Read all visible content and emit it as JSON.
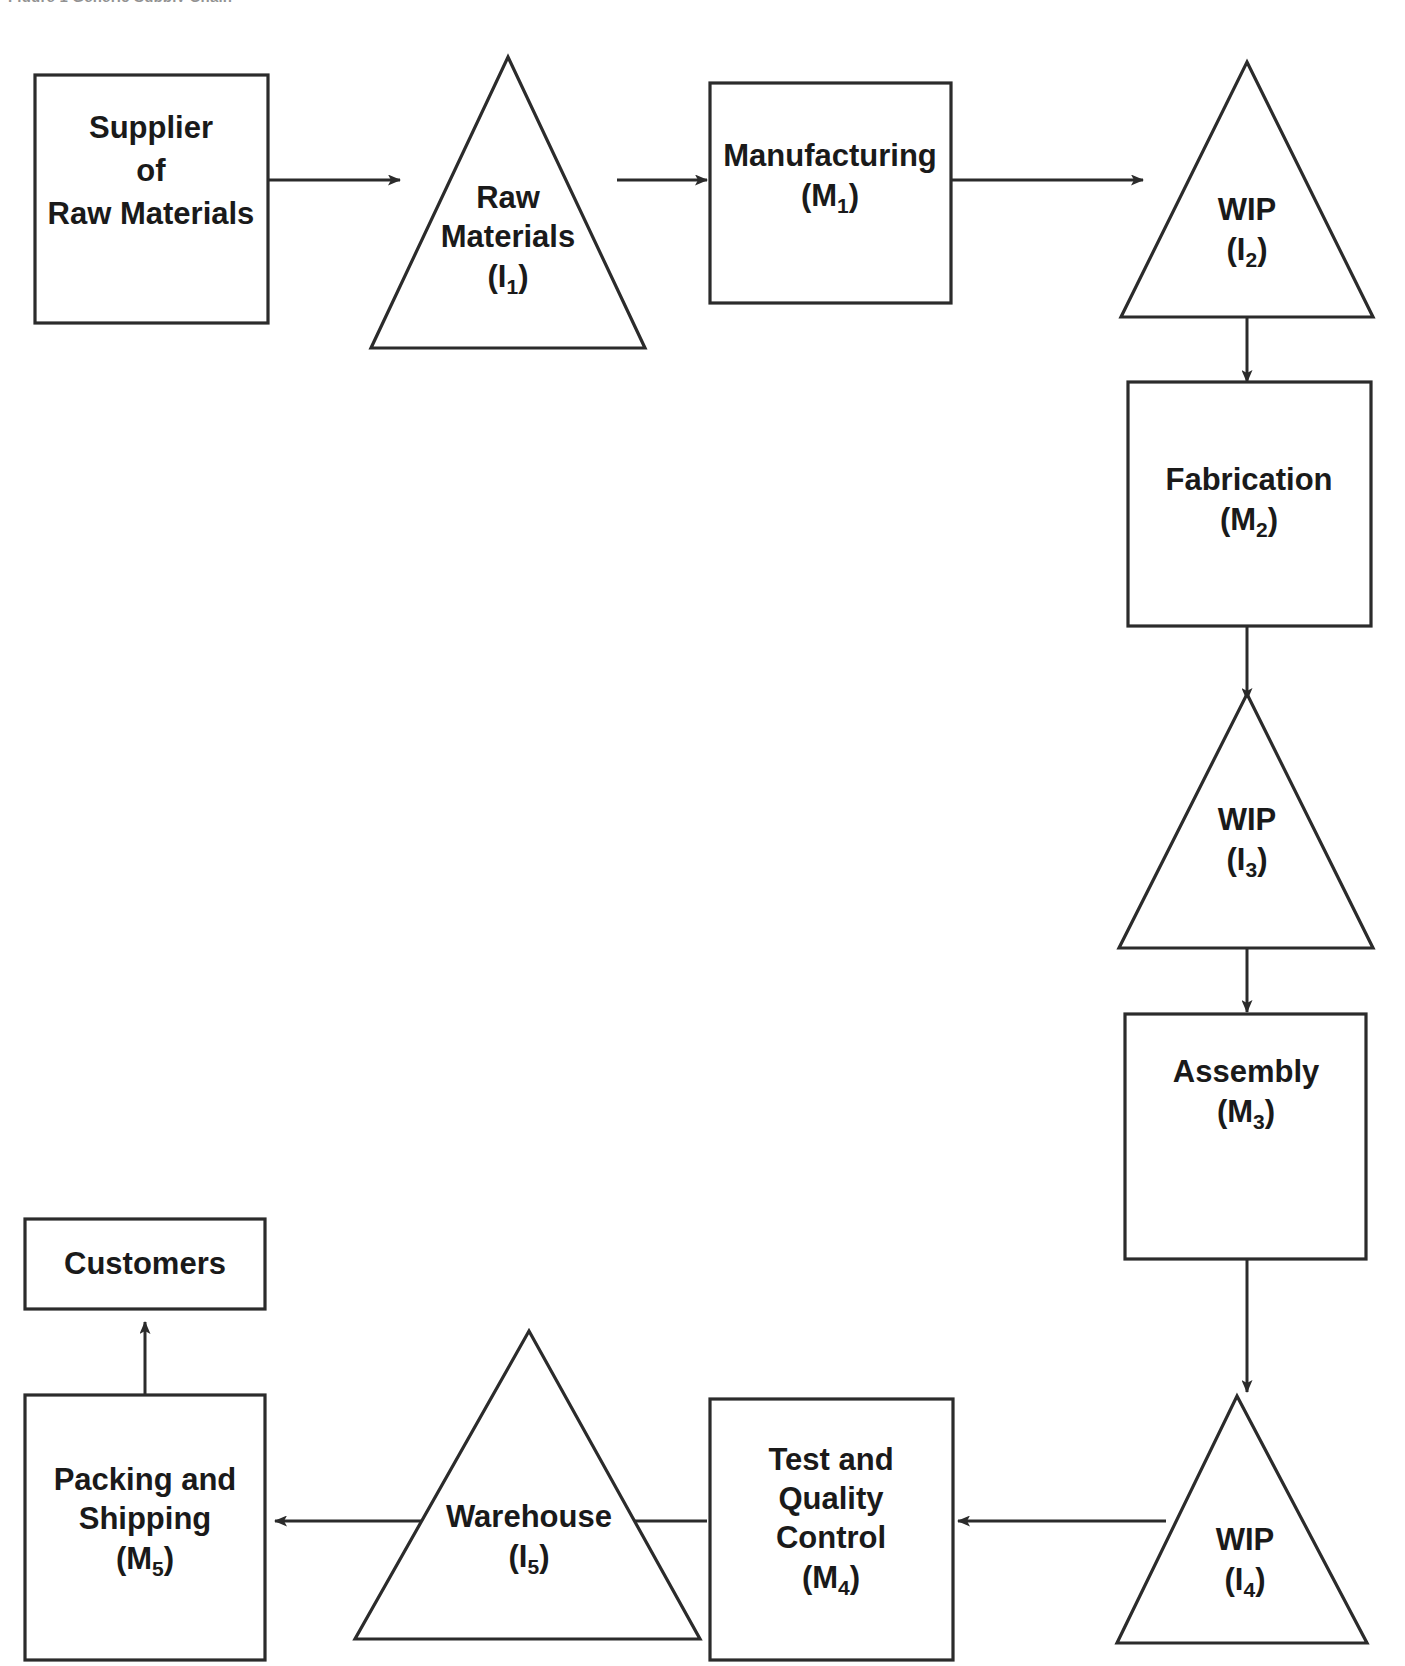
{
  "figure": {
    "caption_partial": "Figure 1   Generic Supply Chain"
  },
  "colors": {
    "stroke": "#2b2b2b",
    "fill": "#ffffff",
    "text": "#1a1a1a",
    "background": "#ffffff"
  },
  "nodes": {
    "supplier": {
      "shape": "rectangle",
      "line1": "Supplier",
      "line2": "of",
      "line3": "Raw Materials"
    },
    "raw_materials": {
      "shape": "triangle",
      "line1": "Raw",
      "line2": "Materials",
      "code_base": "(I",
      "code_sub": "1",
      "code_close": ")"
    },
    "manufacturing": {
      "shape": "rectangle",
      "line1": "Manufacturing",
      "code_base": "(M",
      "code_sub": "1",
      "code_close": ")"
    },
    "wip2": {
      "shape": "triangle",
      "line1": "WIP",
      "code_base": "(I",
      "code_sub": "2",
      "code_close": ")"
    },
    "fabrication": {
      "shape": "rectangle",
      "line1": "Fabrication",
      "code_base": "(M",
      "code_sub": "2",
      "code_close": ")"
    },
    "wip3": {
      "shape": "triangle",
      "line1": "WIP",
      "code_base": "(I",
      "code_sub": "3",
      "code_close": ")"
    },
    "assembly": {
      "shape": "rectangle",
      "line1": "Assembly",
      "code_base": "(M",
      "code_sub": "3",
      "code_close": ")"
    },
    "wip4": {
      "shape": "triangle",
      "line1": "WIP",
      "code_base": "(I",
      "code_sub": "4",
      "code_close": ")"
    },
    "test_quality": {
      "shape": "rectangle",
      "line1": "Test and",
      "line2": "Quality",
      "line3": "Control",
      "code_base": "(M",
      "code_sub": "4",
      "code_close": ")"
    },
    "warehouse": {
      "shape": "triangle",
      "line1": "Warehouse",
      "code_base": "(I",
      "code_sub": "5",
      "code_close": ")"
    },
    "packing_shipping": {
      "shape": "rectangle",
      "line1": "Packing and",
      "line2": "Shipping",
      "code_base": "(M",
      "code_sub": "5",
      "code_close": ")"
    },
    "customers": {
      "shape": "rectangle",
      "line1": "Customers"
    }
  },
  "edges": [
    {
      "id": "supplier-to-raw-materials",
      "from": "supplier",
      "to": "raw_materials",
      "direction": "right"
    },
    {
      "id": "raw-materials-to-manufacturing",
      "from": "raw_materials",
      "to": "manufacturing",
      "direction": "right"
    },
    {
      "id": "manufacturing-to-wip2",
      "from": "manufacturing",
      "to": "wip2",
      "direction": "right"
    },
    {
      "id": "wip2-to-fabrication",
      "from": "wip2",
      "to": "fabrication",
      "direction": "down"
    },
    {
      "id": "fabrication-to-wip3",
      "from": "fabrication",
      "to": "wip3",
      "direction": "down"
    },
    {
      "id": "wip3-to-assembly",
      "from": "wip3",
      "to": "assembly",
      "direction": "down"
    },
    {
      "id": "assembly-to-wip4",
      "from": "assembly",
      "to": "wip4",
      "direction": "down"
    },
    {
      "id": "wip4-to-test-quality",
      "from": "wip4",
      "to": "test_quality",
      "direction": "left"
    },
    {
      "id": "test-quality-to-warehouse",
      "from": "test_quality",
      "to": "warehouse",
      "direction": "left"
    },
    {
      "id": "warehouse-to-packing-shipping",
      "from": "warehouse",
      "to": "packing_shipping",
      "direction": "left"
    },
    {
      "id": "packing-shipping-to-customers",
      "from": "packing_shipping",
      "to": "customers",
      "direction": "up"
    }
  ]
}
